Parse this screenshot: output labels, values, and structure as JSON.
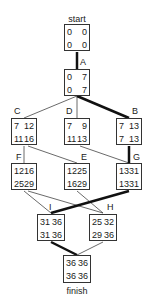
{
  "diagram": {
    "title_top": "start",
    "title_bottom": "finish",
    "nodes": {
      "start": {
        "label": "",
        "es": "0",
        "ef": "0",
        "ls": "0",
        "lf": "0"
      },
      "A": {
        "label": "A",
        "es": "0",
        "ef": "7",
        "ls": "0",
        "lf": "7"
      },
      "C": {
        "label": "C",
        "es": "7",
        "ef": "12",
        "ls": "11",
        "lf": "16"
      },
      "D": {
        "label": "D",
        "es": "7",
        "ef": "9",
        "ls": "11",
        "lf": "13"
      },
      "B": {
        "label": "B",
        "es": "7",
        "ef": "13",
        "ls": "7",
        "lf": "13"
      },
      "F": {
        "label": "F",
        "es": "12",
        "ef": "16",
        "ls": "25",
        "lf": "29"
      },
      "E": {
        "label": "E",
        "es": "12",
        "ef": "25",
        "ls": "16",
        "lf": "29"
      },
      "G": {
        "label": "G",
        "es": "13",
        "ef": "31",
        "ls": "13",
        "lf": "31"
      },
      "I": {
        "label": "I",
        "es": "31",
        "ef": "36",
        "ls": "31",
        "lf": "36"
      },
      "H": {
        "label": "H",
        "es": "25",
        "ef": "32",
        "ls": "29",
        "lf": "36"
      },
      "finish": {
        "label": "",
        "es": "36",
        "ef": "36",
        "ls": "36",
        "lf": "36"
      }
    },
    "edges": [
      {
        "from": "start",
        "to": "A",
        "critical": true
      },
      {
        "from": "A",
        "to": "C",
        "critical": false
      },
      {
        "from": "A",
        "to": "D",
        "critical": false
      },
      {
        "from": "A",
        "to": "B",
        "critical": true
      },
      {
        "from": "C",
        "to": "F",
        "critical": false
      },
      {
        "from": "C",
        "to": "E",
        "critical": false
      },
      {
        "from": "D",
        "to": "G",
        "critical": false
      },
      {
        "from": "B",
        "to": "G",
        "critical": true
      },
      {
        "from": "F",
        "to": "I",
        "critical": false
      },
      {
        "from": "F",
        "to": "H",
        "critical": false
      },
      {
        "from": "E",
        "to": "H",
        "critical": false
      },
      {
        "from": "G",
        "to": "I",
        "critical": true
      },
      {
        "from": "I",
        "to": "finish",
        "critical": true
      },
      {
        "from": "H",
        "to": "finish",
        "critical": false
      }
    ],
    "colors": {
      "line": "#333333",
      "critical": "#111111",
      "box": "#333333"
    }
  }
}
